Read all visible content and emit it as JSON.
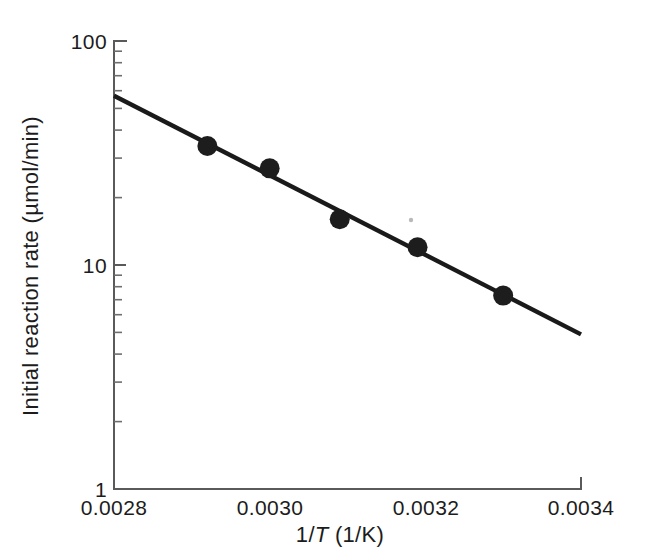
{
  "chart_data": {
    "type": "scatter",
    "title": "",
    "xlabel": "1/T (1/K)",
    "xlabel_parts": {
      "pre": "1/",
      "italic": "T",
      "post": " (1/K)"
    },
    "ylabel": "Initial reaction rate (µmol/min)",
    "xlim": [
      0.0028,
      0.0034
    ],
    "ylim": [
      1,
      100
    ],
    "yscale": "log",
    "xscale": "linear",
    "grid": false,
    "legend": null,
    "xticks": [
      0.0028,
      0.003,
      0.0032,
      0.0034
    ],
    "xtick_labels": [
      "0.0028",
      "0.0030",
      "0.0032",
      "0.0034"
    ],
    "yticks": [
      1,
      10,
      100
    ],
    "ytick_labels": [
      "1",
      "10",
      "100"
    ],
    "y_minor_ticks": [
      2,
      3,
      4,
      5,
      6,
      7,
      8,
      9,
      20,
      30,
      40,
      50,
      60,
      70,
      80,
      90
    ],
    "x": [
      0.00292,
      0.003,
      0.00309,
      0.00319,
      0.0033
    ],
    "y": [
      34,
      27,
      16,
      12,
      7.3
    ],
    "points": [
      {
        "x": 0.00292,
        "y": 34
      },
      {
        "x": 0.003,
        "y": 27
      },
      {
        "x": 0.00309,
        "y": 16
      },
      {
        "x": 0.00319,
        "y": 12
      },
      {
        "x": 0.0033,
        "y": 7.3
      }
    ],
    "fit_line": {
      "name": "linear fit (Arrhenius)",
      "x": [
        0.0028,
        0.0034
      ],
      "y": [
        57.0,
        4.9
      ]
    },
    "marker": "filled-circle",
    "marker_size_px": 20,
    "colors": {
      "marker": "#1d1d1d",
      "line": "#1a1a1a",
      "axis": "#5a5a5a",
      "text": "#1c1c1c",
      "background": "#ffffff"
    }
  }
}
